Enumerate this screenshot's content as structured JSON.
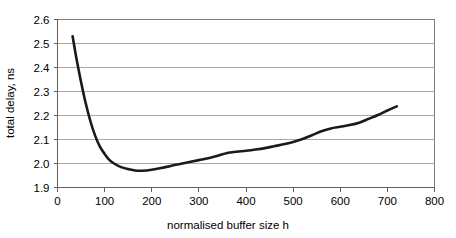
{
  "chart_data": {
    "type": "line",
    "title": "",
    "xlabel": "normalised buffer size h",
    "ylabel": "total delay, ns",
    "xlim": [
      0,
      800
    ],
    "ylim": [
      1.9,
      2.6
    ],
    "xticks": [
      0,
      100,
      200,
      300,
      400,
      500,
      600,
      700,
      800
    ],
    "xtick_labels": [
      "0",
      "100",
      "200",
      "300",
      "400",
      "500",
      "600",
      "700",
      "800"
    ],
    "yticks": [
      1.9,
      2.0,
      2.1,
      2.2,
      2.3,
      2.4,
      2.5,
      2.6
    ],
    "ytick_labels": [
      "1.9",
      "2.0",
      "2.1",
      "2.2",
      "2.3",
      "2.4",
      "2.5",
      "2.6"
    ],
    "grid": "horizontal",
    "legend": "none",
    "series": [
      {
        "name": "total delay",
        "color": "#1a1a1a",
        "x": [
          32,
          40,
          50,
          60,
          70,
          80,
          90,
          100,
          110,
          120,
          135,
          150,
          165,
          180,
          200,
          220,
          240,
          260,
          280,
          300,
          320,
          340,
          360,
          380,
          400,
          420,
          440,
          460,
          480,
          500,
          520,
          540,
          560,
          580,
          600,
          620,
          640,
          660,
          680,
          700,
          720
        ],
        "y": [
          2.53,
          2.44,
          2.34,
          2.25,
          2.175,
          2.115,
          2.07,
          2.04,
          2.015,
          2.0,
          1.985,
          1.977,
          1.971,
          1.97,
          1.974,
          1.981,
          1.99,
          1.998,
          2.006,
          2.014,
          2.022,
          2.032,
          2.044,
          2.049,
          2.053,
          2.058,
          2.064,
          2.072,
          2.08,
          2.09,
          2.102,
          2.118,
          2.134,
          2.146,
          2.153,
          2.16,
          2.17,
          2.186,
          2.202,
          2.221,
          2.238
        ]
      }
    ]
  },
  "axis_titles": {
    "x": "normalised buffer size h",
    "y": "total delay, ns"
  },
  "colors": {
    "series": "#1a1a1a",
    "gridline": "#a9a9a9",
    "border": "#808080",
    "background": "#ffffff"
  }
}
